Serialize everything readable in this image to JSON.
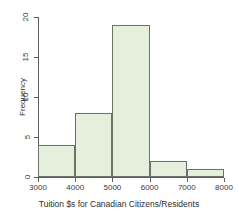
{
  "chart_data": {
    "type": "bar",
    "title": "",
    "subtitle": "",
    "xlabel": "Tuition $s for Canadian Citizens/Residents",
    "ylabel": "Frequency",
    "categories": [
      "3000-4000",
      "4000-5000",
      "5000-6000",
      "6000-7000",
      "7000-8000"
    ],
    "bin_edges": [
      3000,
      4000,
      5000,
      6000,
      7000,
      8000
    ],
    "values": [
      4,
      8,
      19,
      2,
      1
    ],
    "xlim": [
      3000,
      8000
    ],
    "ylim": [
      0,
      20
    ],
    "xticks": [
      3000,
      4000,
      5000,
      6000,
      7000,
      8000
    ],
    "xtick_labels": [
      "3000",
      "4000",
      "5000",
      "6000",
      "7000",
      "8000"
    ],
    "yticks": [
      0,
      5,
      10,
      15,
      20
    ],
    "ytick_labels": [
      "0",
      "5",
      "10",
      "15",
      "20"
    ],
    "grid": false,
    "legend": false,
    "bar_fill_color": "#e6efdc",
    "bar_border_color": "#6b7268",
    "axis_color": "#5c5c5c",
    "background_color": "#ffffff"
  }
}
